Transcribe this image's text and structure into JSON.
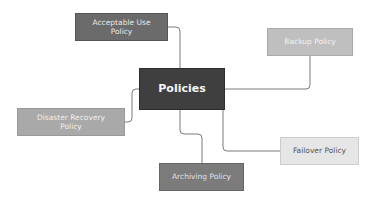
{
  "diagram": {
    "type": "mind-map",
    "center": {
      "label": "Policies",
      "color": "#3f3f3f"
    },
    "branches": [
      {
        "id": "aup",
        "label": "Acceptable Use Policy",
        "color": "#6b6b6b"
      },
      {
        "id": "backup",
        "label": "Backup Policy",
        "color": "#bfbfbf"
      },
      {
        "id": "dr",
        "label": "Disaster Recovery Policy",
        "color": "#a9a9a9"
      },
      {
        "id": "failover",
        "label": "Failover Policy",
        "color": "#e6e6e6"
      },
      {
        "id": "archiving",
        "label": "Archiving Policy",
        "color": "#7b7b7b"
      }
    ],
    "connector_color": "#7a7a7a"
  }
}
